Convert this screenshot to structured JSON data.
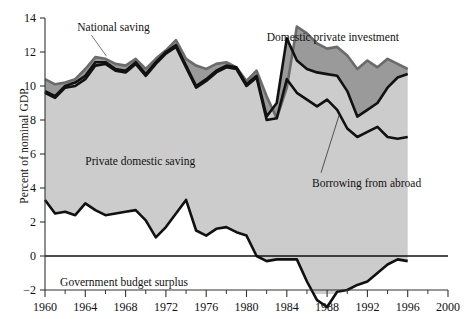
{
  "chart_data": {
    "type": "area",
    "title": "",
    "xlabel": "",
    "ylabel": "Percent of nominal GDP",
    "xlim": [
      1960,
      2000
    ],
    "ylim": [
      -3.2,
      14
    ],
    "grid": false,
    "legend_position": "inline-annotations",
    "yticks": [
      -2,
      0,
      2,
      4,
      6,
      8,
      10,
      12,
      14
    ],
    "ytick_labels": [
      "−2",
      "0",
      "2",
      "4",
      "6",
      "8",
      "10",
      "12",
      "14"
    ],
    "xticks": [
      1960,
      1964,
      1968,
      1972,
      1976,
      1980,
      1984,
      1988,
      1992,
      1996,
      2000
    ],
    "xtick_labels": [
      "1960",
      "1964",
      "1968",
      "1972",
      "1976",
      "1980",
      "1984",
      "1988",
      "1992",
      "1996",
      "2000"
    ],
    "xminor_ticks": [
      1962,
      1966,
      1970,
      1974,
      1978,
      1982,
      1986,
      1990,
      1994,
      1998
    ],
    "x": [
      1960,
      1961,
      1962,
      1963,
      1964,
      1965,
      1966,
      1967,
      1968,
      1969,
      1970,
      1971,
      1972,
      1973,
      1974,
      1975,
      1976,
      1977,
      1978,
      1979,
      1980,
      1981,
      1982,
      1983,
      1984,
      1985,
      1986,
      1987,
      1988,
      1989,
      1990,
      1991,
      1992,
      1993,
      1994,
      1995,
      1996
    ],
    "annotations": [
      {
        "text": "National saving",
        "x": 1963.2,
        "y": 13.5
      },
      {
        "text": "Domestic private investment",
        "x": 1982.0,
        "y": 12.9
      },
      {
        "text": "Private domestic saving",
        "x": 1964.0,
        "y": 5.6
      },
      {
        "text": "Borrowing from abroad",
        "x": 1986.5,
        "y": 4.3
      },
      {
        "text": "Government budget surplus",
        "x": 1961.5,
        "y": -1.5
      }
    ],
    "series": [
      {
        "name": "National saving",
        "color": "#6b6b6b",
        "values": [
          10.4,
          10.1,
          10.2,
          10.4,
          11.0,
          11.7,
          11.6,
          11.3,
          11.2,
          11.6,
          11.0,
          11.6,
          12.1,
          12.7,
          11.6,
          11.2,
          11.0,
          11.3,
          11.4,
          11.1,
          10.3,
          10.9,
          9.4,
          8.1,
          9.9,
          13.5,
          13.1,
          12.5,
          12.2,
          12.3,
          11.8,
          11.0,
          11.5,
          11.1,
          11.6,
          11.3,
          11.0
        ]
      },
      {
        "name": "Domestic private investment",
        "color": "#111111",
        "values": [
          9.7,
          9.4,
          10.0,
          10.0,
          10.4,
          11.2,
          11.3,
          11.0,
          10.9,
          11.3,
          10.7,
          11.3,
          11.9,
          12.3,
          11.2,
          10.8,
          10.6,
          10.9,
          11.0,
          11.0,
          9.9,
          10.5,
          8.2,
          8.0,
          9.6,
          13.0,
          12.6,
          11.9,
          11.5,
          11.6,
          10.9,
          9.5,
          10.2,
          10.2,
          11.0,
          10.7,
          10.6
        ]
      },
      {
        "name": "Private domestic saving",
        "color": "#111111",
        "values": [
          9.7,
          9.4,
          10.0,
          10.0,
          10.4,
          11.2,
          11.3,
          11.0,
          10.9,
          11.3,
          10.7,
          11.3,
          11.9,
          12.3,
          11.2,
          10.8,
          10.6,
          10.9,
          11.0,
          11.0,
          9.9,
          10.5,
          8.2,
          8.0,
          9.6,
          13.0,
          12.6,
          11.9,
          11.5,
          11.6,
          10.9,
          9.5,
          10.2,
          10.2,
          11.0,
          10.7,
          10.6
        ]
      },
      {
        "name": "Government budget surplus",
        "color": "#111111",
        "values": [
          3.3,
          2.6,
          2.5,
          2.7,
          3.1,
          2.6,
          2.8,
          2.4,
          2.6,
          2.7,
          2.6,
          2.4,
          1.1,
          1.6,
          2.4,
          3.3,
          1.4,
          0.4,
          -0.4,
          0.8,
          1.4,
          1.8,
          1.2,
          1.3,
          -3.0,
          -1.2,
          -0.2,
          0.1,
          0.2,
          0.2,
          0.1,
          0.2,
          0.2,
          0.1,
          0.1,
          0.2,
          0.3
        ]
      }
    ],
    "upper_band": {
      "name": "national-saving-upper",
      "x": [
        1960,
        1961,
        1962,
        1963,
        1964,
        1965,
        1966,
        1967,
        1968,
        1969,
        1970,
        1971,
        1972,
        1973,
        1974,
        1975,
        1976,
        1977,
        1978,
        1979,
        1980,
        1981,
        1982,
        1983,
        1984,
        1985,
        1986,
        1987,
        1988,
        1989,
        1990,
        1991,
        1992,
        1993,
        1994,
        1995,
        1996
      ],
      "values": [
        10.4,
        10.1,
        10.2,
        10.4,
        11.0,
        11.7,
        11.6,
        11.3,
        11.2,
        11.6,
        11.0,
        11.6,
        12.1,
        12.7,
        11.6,
        11.2,
        11.0,
        11.3,
        11.4,
        11.1,
        10.3,
        10.9,
        9.4,
        8.1,
        9.9,
        13.5,
        13.1,
        12.5,
        12.2,
        12.3,
        11.8,
        11.0,
        11.5,
        11.1,
        11.6,
        11.3,
        11.0
      ]
    },
    "investment_line": {
      "name": "domestic-private-investment",
      "x": [
        1960,
        1961,
        1962,
        1963,
        1964,
        1965,
        1966,
        1967,
        1968,
        1969,
        1970,
        1971,
        1972,
        1973,
        1974,
        1975,
        1976,
        1977,
        1978,
        1979,
        1980,
        1981,
        1982,
        1983,
        1984,
        1985,
        1986,
        1987,
        1988,
        1989,
        1990,
        1991,
        1992,
        1993,
        1994,
        1995,
        1996
      ],
      "values": [
        9.7,
        9.4,
        10.0,
        10.2,
        10.6,
        11.4,
        11.4,
        11.0,
        10.9,
        11.4,
        10.7,
        11.4,
        12.0,
        12.4,
        11.2,
        10.0,
        10.4,
        10.9,
        11.2,
        11.1,
        10.1,
        10.6,
        8.2,
        9.0,
        12.8,
        11.5,
        11.0,
        10.8,
        10.7,
        10.6,
        9.7,
        8.2,
        8.6,
        9.0,
        9.9,
        10.5,
        10.7
      ]
    },
    "saving_line": {
      "name": "private-domestic-saving",
      "x": [
        1960,
        1961,
        1962,
        1963,
        1964,
        1965,
        1966,
        1967,
        1968,
        1969,
        1970,
        1971,
        1972,
        1973,
        1974,
        1975,
        1976,
        1977,
        1978,
        1979,
        1980,
        1981,
        1982,
        1983,
        1984,
        1985,
        1986,
        1987,
        1988,
        1989,
        1990,
        1991,
        1992,
        1993,
        1994,
        1995,
        1996
      ],
      "values": [
        9.6,
        9.3,
        9.9,
        10.0,
        10.4,
        11.2,
        11.3,
        10.9,
        10.8,
        11.3,
        10.6,
        11.3,
        11.9,
        12.3,
        11.1,
        9.9,
        10.3,
        10.8,
        11.1,
        11.0,
        10.0,
        10.5,
        8.0,
        8.1,
        10.4,
        9.6,
        9.2,
        8.8,
        9.2,
        8.6,
        7.5,
        7.0,
        7.3,
        7.6,
        7.0,
        6.9,
        7.0
      ]
    },
    "gov_line": {
      "name": "government-budget-surplus",
      "x": [
        1960,
        1961,
        1962,
        1963,
        1964,
        1965,
        1966,
        1967,
        1968,
        1969,
        1970,
        1971,
        1972,
        1973,
        1974,
        1975,
        1976,
        1977,
        1978,
        1979,
        1980,
        1981,
        1982,
        1983,
        1984,
        1985,
        1986,
        1987,
        1988,
        1989,
        1990,
        1991,
        1992,
        1993,
        1994,
        1995,
        1996
      ],
      "values": [
        3.3,
        2.5,
        2.6,
        2.4,
        3.1,
        2.7,
        2.4,
        2.5,
        2.6,
        2.7,
        2.1,
        1.1,
        1.7,
        2.5,
        3.3,
        1.5,
        1.2,
        1.6,
        1.7,
        1.4,
        1.2,
        0.0,
        -0.3,
        -0.2,
        -0.2,
        -0.2,
        -1.5,
        -2.6,
        -3.0,
        -2.1,
        -2.0,
        -1.7,
        -1.5,
        -1.0,
        -0.5,
        -0.2,
        -0.3
      ]
    }
  },
  "colors": {
    "fill_gray": "#cccccc",
    "line_black": "#111111",
    "line_gray": "#6b6b6b",
    "axis": "#333333",
    "background": "#ffffff"
  }
}
